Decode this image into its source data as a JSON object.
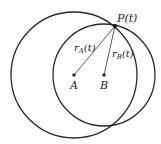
{
  "diagram": {
    "circles": [
      {
        "name": "circle-A",
        "cx": 74,
        "cy": 75,
        "r": 63
      },
      {
        "name": "circle-B",
        "cx": 104,
        "cy": 75,
        "r": 51
      }
    ],
    "points": {
      "A": {
        "x": 74,
        "y": 75,
        "label": "A"
      },
      "B": {
        "x": 104,
        "y": 75,
        "label": "B"
      },
      "P": {
        "x": 115,
        "y": 26,
        "label": "P(t)"
      }
    },
    "segments": {
      "rA": {
        "label_main": "r",
        "label_sub": "A",
        "label_arg": "(t)"
      },
      "rB": {
        "label_main": "r",
        "label_sub": "B",
        "label_arg": "(t)"
      }
    },
    "colors": {
      "stroke": "#2a2a2a",
      "point": "#333333"
    }
  }
}
